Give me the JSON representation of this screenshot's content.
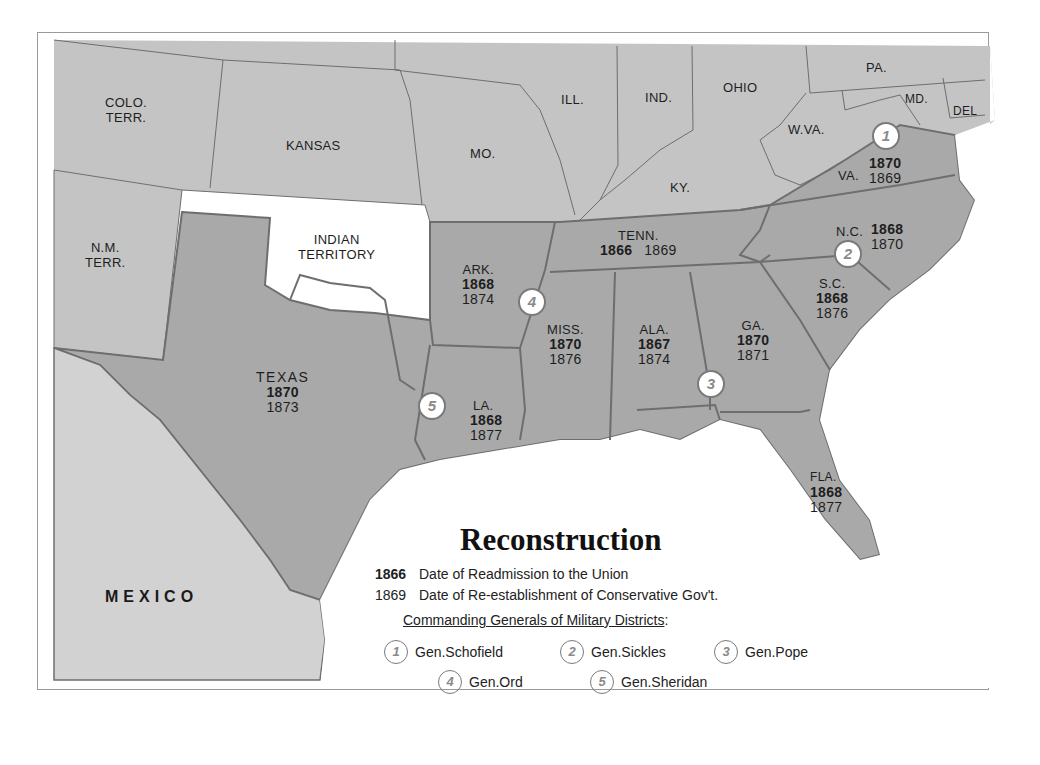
{
  "map": {
    "title": "Reconstruction",
    "colors": {
      "land_other": "#c4c4c4",
      "land_confederate": "#a9a9a9",
      "mexico": "#d2d2d2",
      "water": "#ffffff",
      "border": "#6e6e6e"
    },
    "regions": [
      {
        "name": "COLO. TERR.",
        "lines": [
          "COLO.",
          "TERR."
        ]
      },
      {
        "name": "KANSAS",
        "lines": [
          "KANSAS"
        ]
      },
      {
        "name": "MO.",
        "lines": [
          "MO."
        ]
      },
      {
        "name": "ILL.",
        "lines": [
          "ILL."
        ]
      },
      {
        "name": "IND.",
        "lines": [
          "IND."
        ]
      },
      {
        "name": "OHIO",
        "lines": [
          "OHIO"
        ]
      },
      {
        "name": "PA.",
        "lines": [
          "PA."
        ]
      },
      {
        "name": "MD.",
        "lines": [
          "MD."
        ]
      },
      {
        "name": "DEL",
        "lines": [
          "DEL"
        ]
      },
      {
        "name": "W.VA.",
        "lines": [
          "W.VA."
        ]
      },
      {
        "name": "KY.",
        "lines": [
          "KY."
        ]
      },
      {
        "name": "N.M. TERR.",
        "lines": [
          "N.M.",
          "TERR."
        ]
      },
      {
        "name": "INDIAN TERRITORY",
        "lines": [
          "INDIAN",
          "TERRITORY"
        ]
      },
      {
        "name": "MEXICO",
        "lines": [
          "MEXICO"
        ]
      }
    ],
    "states": [
      {
        "name": "VA.",
        "readmission": "1870",
        "conservative": "1869"
      },
      {
        "name": "N.C.",
        "readmission": "1868",
        "conservative": "1870"
      },
      {
        "name": "TENN.",
        "readmission": "1866",
        "conservative": "1869"
      },
      {
        "name": "ARK.",
        "readmission": "1868",
        "conservative": "1874"
      },
      {
        "name": "S.C.",
        "readmission": "1868",
        "conservative": "1876"
      },
      {
        "name": "MISS.",
        "readmission": "1870",
        "conservative": "1876"
      },
      {
        "name": "ALA.",
        "readmission": "1867",
        "conservative": "1874"
      },
      {
        "name": "GA.",
        "readmission": "1870",
        "conservative": "1871"
      },
      {
        "name": "TEXAS",
        "readmission": "1870",
        "conservative": "1873"
      },
      {
        "name": "LA.",
        "readmission": "1868",
        "conservative": "1877"
      },
      {
        "name": "FLA.",
        "readmission": "1868",
        "conservative": "1877"
      }
    ],
    "district_markers": [
      "1",
      "2",
      "3",
      "4",
      "5"
    ]
  },
  "legend": {
    "readmission_sample": "1866",
    "readmission_text": "Date of Readmission to the Union",
    "conservative_sample": "1869",
    "conservative_text": "Date of Re-establishment of Conservative Gov't.",
    "generals_heading": "Commanding Generals of Military Districts",
    "generals_heading_suffix": ":",
    "generals": [
      {
        "num": "1",
        "name": "Gen.Schofield"
      },
      {
        "num": "2",
        "name": "Gen.Sickles"
      },
      {
        "num": "3",
        "name": "Gen.Pope"
      },
      {
        "num": "4",
        "name": "Gen.Ord"
      },
      {
        "num": "5",
        "name": "Gen.Sheridan"
      }
    ]
  }
}
